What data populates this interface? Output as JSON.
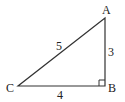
{
  "diagram": {
    "type": "right-triangle",
    "vertices": {
      "A": {
        "label": "A",
        "x": 105,
        "y": 18
      },
      "B": {
        "label": "B",
        "x": 105,
        "y": 86
      },
      "C": {
        "label": "C",
        "x": 18,
        "y": 86
      }
    },
    "sides": {
      "AC": {
        "label": "5"
      },
      "AB": {
        "label": "3"
      },
      "CB": {
        "label": "4"
      }
    },
    "right_angle_at": "B",
    "stroke_color": "#333333"
  }
}
